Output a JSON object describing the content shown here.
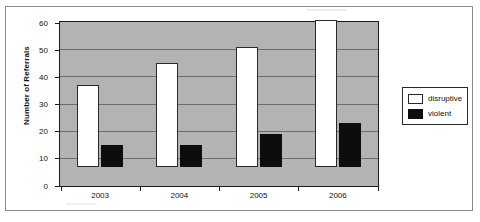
{
  "chart_data": {
    "type": "bar",
    "title": "",
    "subtitle": "",
    "xlabel": "",
    "ylabel": "Number of Referrals",
    "categories": [
      "2003",
      "2004",
      "2005",
      "2006"
    ],
    "series": [
      {
        "name": "disruptive",
        "values": [
          30,
          38,
          44,
          54
        ],
        "color": "#ffffff"
      },
      {
        "name": "violent",
        "values": [
          8,
          8,
          12,
          16
        ],
        "color": "#0d0d0d"
      }
    ],
    "ylim": [
      0,
      60
    ],
    "yticks": [
      0,
      10,
      20,
      30,
      40,
      50,
      60
    ],
    "ytick_labels": [
      "0",
      "10",
      "20",
      "30",
      "40",
      "50",
      "60"
    ],
    "grid": true,
    "grid_axis": "y",
    "legend_position": "right",
    "plot_background": "#b3b3b3",
    "axis_color": "#1c1c1c",
    "gridline_color": "#6d6d6d"
  },
  "legend": {
    "entries": [
      {
        "label": "disruptive",
        "swatch": "white-square-swatch"
      },
      {
        "label": "violent",
        "swatch": "black-square-swatch"
      }
    ]
  }
}
